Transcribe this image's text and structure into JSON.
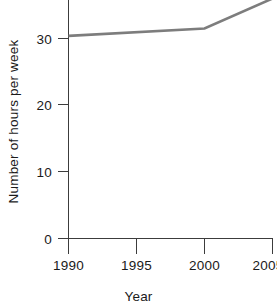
{
  "chart_data": {
    "type": "line",
    "title": "",
    "xlabel": "Year",
    "ylabel": "Number of hours per week",
    "x": [
      1990,
      2000,
      2005
    ],
    "values": [
      30.4,
      31.5,
      36.0
    ],
    "series": [
      {
        "name": "Number of hours per week",
        "x": [
          1990,
          2000,
          2005
        ],
        "values": [
          30.4,
          31.5,
          36.0
        ]
      }
    ],
    "xticks": [
      1990,
      1995,
      2000,
      2005
    ],
    "xtick_labels": [
      "1990",
      "1995",
      "2000",
      "2005"
    ],
    "yticks": [
      0,
      10,
      20,
      30
    ],
    "ytick_labels": [
      "0",
      "10",
      "20",
      "30"
    ],
    "xlim": [
      1990,
      2005
    ],
    "ylim": [
      0,
      35.5
    ],
    "grid": false,
    "legend": false,
    "line_color": "#7d7d7d",
    "axis_color": "#3c3c3c",
    "note": "Line is clipped at the top edge of the plot area above 2003."
  },
  "axis": {
    "x_title": "Year",
    "y_title": "Number of hours per week"
  }
}
